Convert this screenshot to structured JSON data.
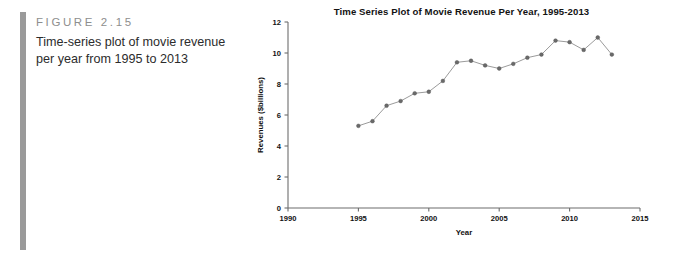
{
  "figure": {
    "label": "FIGURE 2.15",
    "caption": "Time-series plot of movie revenue per year from 1995 to 2013",
    "accent_color": "#9a9a9a"
  },
  "chart_data": {
    "type": "line",
    "title": "Time Series Plot of Movie Revenue Per Year, 1995-2013",
    "xlabel": "Year",
    "ylabel": "Revenues ($billions)",
    "xlim": [
      1990,
      2015
    ],
    "ylim": [
      0,
      12
    ],
    "xticks": [
      1990,
      1995,
      2000,
      2005,
      2010,
      2015
    ],
    "yticks": [
      0,
      2,
      4,
      6,
      8,
      10,
      12
    ],
    "grid": false,
    "legend": "none",
    "marker": "circle",
    "line_color": "#9b9b9b",
    "marker_color": "#6a6a6a",
    "x": [
      1995,
      1996,
      1997,
      1998,
      1999,
      2000,
      2001,
      2002,
      2003,
      2004,
      2005,
      2006,
      2007,
      2008,
      2009,
      2010,
      2011,
      2012,
      2013
    ],
    "values": [
      5.3,
      5.6,
      6.6,
      6.9,
      7.4,
      7.5,
      8.2,
      9.4,
      9.5,
      9.2,
      9.0,
      9.3,
      9.7,
      9.9,
      10.8,
      10.7,
      10.2,
      11.0,
      9.9
    ],
    "series": [
      {
        "name": "Movie revenue",
        "values": [
          5.3,
          5.6,
          6.6,
          6.9,
          7.4,
          7.5,
          8.2,
          9.4,
          9.5,
          9.2,
          9.0,
          9.3,
          9.7,
          9.9,
          10.8,
          10.7,
          10.2,
          11.0,
          9.9
        ]
      }
    ]
  }
}
